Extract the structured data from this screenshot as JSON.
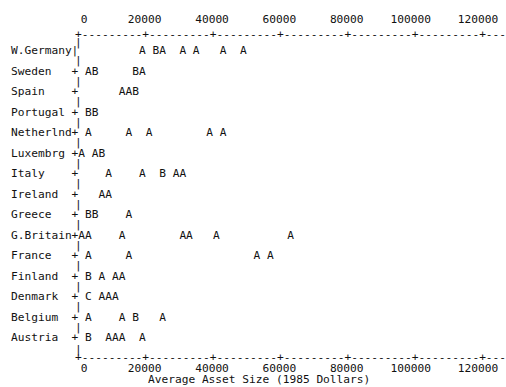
{
  "chart_data": {
    "type": "scatter",
    "title": "",
    "subtitle": "",
    "xlabel": "Average Asset Size (1985 Dollars)",
    "ylabel": "",
    "xlim": [
      0,
      125000
    ],
    "x_ticks": [
      0,
      20000,
      40000,
      60000,
      80000,
      100000,
      120000
    ],
    "x_tick_labels": [
      "0",
      "20000",
      "40000",
      "60000",
      "80000",
      "100000",
      "120000"
    ],
    "grid": false,
    "legend_position": "none",
    "axis_style": "ascii-dashed",
    "top_axis_row": "+---------+---------+---------+---------+---------+---------+---",
    "bottom_axis_row": "+---------+---------+---------+---------+---------+---------+---",
    "categories": [
      "W.Germany",
      "Sweden",
      "Spain",
      "Portugal",
      "Netherlnd",
      "Luxembrg",
      "Italy",
      "Ireland",
      "Greece",
      "G.Britain",
      "France",
      "Finland",
      "Denmark",
      "Belgium",
      "Austria"
    ],
    "point_symbols": [
      "A",
      "B",
      "C"
    ],
    "series": [
      {
        "name": "W.Germany",
        "axis_marker": "|",
        "points": [
          {
            "label": "A",
            "x": 24000
          },
          {
            "label": "B",
            "x": 29000
          },
          {
            "label": "A",
            "x": 31000
          },
          {
            "label": "A",
            "x": 37000
          },
          {
            "label": "A",
            "x": 42000
          },
          {
            "label": "A",
            "x": 49000
          },
          {
            "label": "A",
            "x": 56000
          }
        ]
      },
      {
        "name": "Sweden",
        "axis_marker": "+",
        "points": [
          {
            "label": "A",
            "x": 5000
          },
          {
            "label": "B",
            "x": 7000
          },
          {
            "label": "B",
            "x": 17000
          },
          {
            "label": "A",
            "x": 19000
          }
        ]
      },
      {
        "name": "Spain",
        "axis_marker": "+",
        "points": [
          {
            "label": "A",
            "x": 13000
          },
          {
            "label": "A",
            "x": 15000
          },
          {
            "label": "B",
            "x": 17000
          }
        ]
      },
      {
        "name": "Portugal",
        "axis_marker": "+",
        "points": [
          {
            "label": "B",
            "x": 5000
          },
          {
            "label": "B",
            "x": 7000
          }
        ]
      },
      {
        "name": "Netherlnd",
        "axis_marker": "+",
        "points": [
          {
            "label": "A",
            "x": 3000
          },
          {
            "label": "A",
            "x": 17000
          },
          {
            "label": "A",
            "x": 24000
          },
          {
            "label": "A",
            "x": 42000
          },
          {
            "label": "A",
            "x": 46000
          }
        ]
      },
      {
        "name": "Luxembrg",
        "axis_marker": "+",
        "points": [
          {
            "label": "A",
            "x": 1000
          },
          {
            "label": "A",
            "x": 5000
          },
          {
            "label": "B",
            "x": 7000
          }
        ]
      },
      {
        "name": "Italy",
        "axis_marker": "+",
        "points": [
          {
            "label": "A",
            "x": 12000
          },
          {
            "label": "A",
            "x": 24000
          },
          {
            "label": "B",
            "x": 31000
          },
          {
            "label": "A",
            "x": 35000
          },
          {
            "label": "A",
            "x": 37000
          }
        ]
      },
      {
        "name": "Ireland",
        "axis_marker": "+",
        "points": [
          {
            "label": "A",
            "x": 7000
          },
          {
            "label": "A",
            "x": 9000
          }
        ]
      },
      {
        "name": "Greece",
        "axis_marker": "+",
        "points": [
          {
            "label": "B",
            "x": 5000
          },
          {
            "label": "B",
            "x": 7000
          },
          {
            "label": "A",
            "x": 17000
          }
        ]
      },
      {
        "name": "G.Britain",
        "axis_marker": "+",
        "points": [
          {
            "label": "A",
            "x": 0
          },
          {
            "label": "A",
            "x": 2000
          },
          {
            "label": "A",
            "x": 14000
          },
          {
            "label": "A",
            "x": 45000
          },
          {
            "label": "A",
            "x": 47000
          },
          {
            "label": "A",
            "x": 56000
          },
          {
            "label": "A",
            "x": 97000
          }
        ]
      },
      {
        "name": "France",
        "axis_marker": "+",
        "points": [
          {
            "label": "A",
            "x": 5000
          },
          {
            "label": "A",
            "x": 21000
          },
          {
            "label": "A",
            "x": 91000
          },
          {
            "label": "A",
            "x": 95000
          }
        ]
      },
      {
        "name": "Finland",
        "axis_marker": "+",
        "points": [
          {
            "label": "B",
            "x": 5000
          },
          {
            "label": "A",
            "x": 9000
          },
          {
            "label": "A",
            "x": 14000
          },
          {
            "label": "A",
            "x": 16000
          }
        ]
      },
      {
        "name": "Denmark",
        "axis_marker": "+",
        "points": [
          {
            "label": "C",
            "x": 7000
          },
          {
            "label": "A",
            "x": 12000
          },
          {
            "label": "A",
            "x": 14000
          },
          {
            "label": "A",
            "x": 16000
          }
        ]
      },
      {
        "name": "Belgium",
        "axis_marker": "+",
        "points": [
          {
            "label": "A",
            "x": 5000
          },
          {
            "label": "A",
            "x": 19000
          },
          {
            "label": "B",
            "x": 24000
          },
          {
            "label": "A",
            "x": 33000
          }
        ]
      },
      {
        "name": "Austria",
        "axis_marker": "+",
        "points": [
          {
            "label": "B",
            "x": 5000
          },
          {
            "label": "A",
            "x": 12000
          },
          {
            "label": "A",
            "x": 14000
          },
          {
            "label": "A",
            "x": 16000
          },
          {
            "label": "A",
            "x": 24000
          }
        ]
      }
    ],
    "ascii_rows": [
      {
        "name": "W.Germany",
        "text": "W.Germany|         A BA  A A   A  A"
      },
      {
        "name": "Sweden",
        "text": "Sweden   + AB     BA"
      },
      {
        "name": "Spain",
        "text": "Spain    +      AAB"
      },
      {
        "name": "Portugal",
        "text": "Portugal + BB"
      },
      {
        "name": "Netherlnd",
        "text": "Netherlnd+ A     A  A        A A"
      },
      {
        "name": "Luxembrg",
        "text": "Luxembrg +A AB"
      },
      {
        "name": "Italy",
        "text": "Italy    +    A    A  B AA"
      },
      {
        "name": "Ireland",
        "text": "Ireland  +   AA"
      },
      {
        "name": "Greece",
        "text": "Greece   + BB    A"
      },
      {
        "name": "G.Britain",
        "text": "G.Britain+AA    A        AA   A          A"
      },
      {
        "name": "France",
        "text": "France   + A     A                  A A"
      },
      {
        "name": "Finland",
        "text": "Finland  + B A AA"
      },
      {
        "name": "Denmark",
        "text": "Denmark  + C AAA"
      },
      {
        "name": "Belgium",
        "text": "Belgium  + A    A B   A"
      },
      {
        "name": "Austria",
        "text": "Austria  + B  AAA  A"
      }
    ]
  },
  "axis": {
    "top_tick_label_row": "     0      20000     40000     60000     80000    100000    120000",
    "bottom_tick_label_row": "     0      20000     40000     60000     80000    100000    120000",
    "x_axis_title": "Average Asset Size (1985 Dollars)"
  }
}
